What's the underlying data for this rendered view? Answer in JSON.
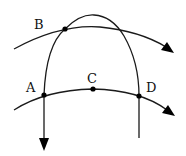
{
  "diagram": {
    "type": "curves-and-points",
    "colors": {
      "stroke": "#1a1a1a",
      "background": "#ffffff",
      "text": "#111111"
    },
    "points": [
      {
        "id": "B",
        "label": "B",
        "x": 65,
        "y": 29,
        "label_x": 35,
        "label_y": 29,
        "dot": true
      },
      {
        "id": "A",
        "label": "A",
        "x": 44,
        "y": 95,
        "label_x": 27,
        "label_y": 91,
        "dot": true
      },
      {
        "id": "C",
        "label": "C",
        "x": 93,
        "y": 89,
        "label_x": 88,
        "label_y": 82,
        "dot": true
      },
      {
        "id": "D",
        "label": "D",
        "x": 139,
        "y": 96,
        "label_x": 146,
        "label_y": 92,
        "dot": true
      }
    ],
    "curves": [
      {
        "id": "upper-curve",
        "description": "curve through B ending with arrow to the right",
        "arrow": "end"
      },
      {
        "id": "lower-curve",
        "description": "curve through A, C, D ending with arrow to the right",
        "arrow": "end"
      },
      {
        "id": "arch",
        "description": "arch through B and A (left leg with downward arrow) and D (right leg, no arrow)",
        "arrow": "left-leg-down"
      }
    ]
  }
}
